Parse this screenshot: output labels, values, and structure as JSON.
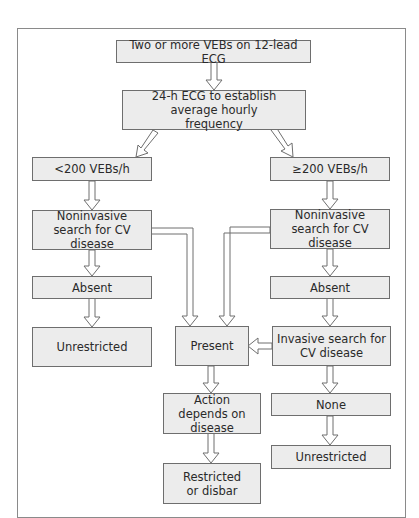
{
  "diagram": {
    "title": "",
    "colors": {
      "box_fill": "#ececec",
      "box_border": "#6e6e6e",
      "arrow_stroke": "#6e6e6e",
      "arrow_fill": "#ffffff",
      "frame_border": "#8a8a8a"
    },
    "nodes": {
      "start": "Two or more VEBs on 12-lead ECG",
      "holter": "24-h ECG to establish average hourly frequency",
      "low_freq": "<200 VEBs/h",
      "high_freq": "≥200 VEBs/h",
      "low_noninvasive": "Noninvasive search for CV disease",
      "high_noninvasive": "Noninvasive search for CV disease",
      "low_absent": "Absent",
      "high_absent": "Absent",
      "low_unrestricted": "Unrestricted",
      "present": "Present",
      "invasive": "Invasive search for CV disease",
      "action": "Action depends on disease",
      "none": "None",
      "restricted": "Restricted or disbar",
      "high_unrestricted": "Unrestricted"
    },
    "edges": [
      {
        "from": "start",
        "to": "holter"
      },
      {
        "from": "holter",
        "to": "low_freq"
      },
      {
        "from": "holter",
        "to": "high_freq"
      },
      {
        "from": "low_freq",
        "to": "low_noninvasive"
      },
      {
        "from": "high_freq",
        "to": "high_noninvasive"
      },
      {
        "from": "low_noninvasive",
        "to": "low_absent"
      },
      {
        "from": "low_noninvasive",
        "to": "present"
      },
      {
        "from": "high_noninvasive",
        "to": "high_absent"
      },
      {
        "from": "high_noninvasive",
        "to": "present"
      },
      {
        "from": "low_absent",
        "to": "low_unrestricted"
      },
      {
        "from": "high_absent",
        "to": "invasive"
      },
      {
        "from": "invasive",
        "to": "present"
      },
      {
        "from": "invasive",
        "to": "none"
      },
      {
        "from": "present",
        "to": "action"
      },
      {
        "from": "action",
        "to": "restricted"
      },
      {
        "from": "none",
        "to": "high_unrestricted"
      }
    ]
  }
}
